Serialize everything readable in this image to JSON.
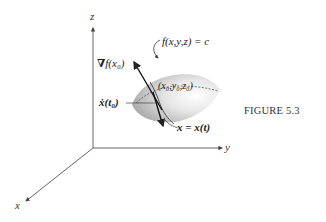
{
  "figure": {
    "caption": "FIGURE 5.3",
    "axes": {
      "x_label": "x",
      "y_label": "y",
      "z_label": "z"
    },
    "labels": {
      "surface": "f(x,y,z) = c",
      "point": "(x₀,y₀,z₀)",
      "gradient_symbol": "∇",
      "gradient": "f(x₀)",
      "velocity": "ẋ(t₀)",
      "curve": "x = x(t)"
    },
    "colors": {
      "line": "#333333",
      "surface_light": "#f4f4f4",
      "surface_dark": "#bdbdbd",
      "text": "#222222"
    }
  }
}
